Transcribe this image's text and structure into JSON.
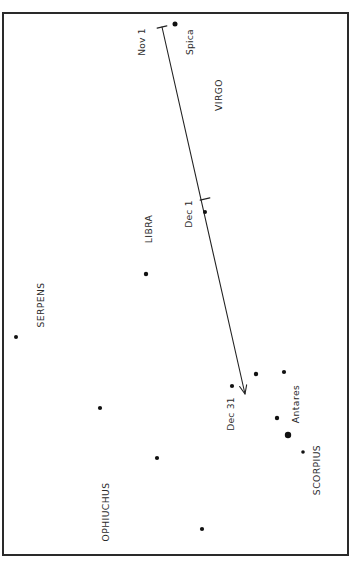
{
  "figure": {
    "kind": "star-chart",
    "background_color": "#ffffff",
    "frame_color": "#2a2a2a",
    "star_color": "#111111",
    "path_color": "#232323",
    "label_color": "#2b2b2b",
    "orientation_note": "all text rendered rotated 90 degrees (reading bottom-to-top)"
  },
  "chart_data": {
    "type": "scatter",
    "title": "",
    "subtitle": "",
    "xlabel": "",
    "ylabel": "",
    "grid": false,
    "legend": "none",
    "xlim": [
      3,
      348
    ],
    "ylim": [
      13,
      555
    ],
    "axis_units": "pixels",
    "frame": {
      "x": 3,
      "y": 13,
      "width": 345,
      "height": 542
    },
    "series": [
      {
        "name": "Stars",
        "type": "scatter",
        "points": [
          {
            "label": "Spica",
            "x": 175,
            "y": 24,
            "size": 5.0,
            "magnitude_rank": 2
          },
          {
            "label": "",
            "x": 205,
            "y": 212,
            "size": 4.0,
            "magnitude_rank": 3
          },
          {
            "label": "",
            "x": 146,
            "y": 274,
            "size": 4.4,
            "magnitude_rank": 3
          },
          {
            "label": "",
            "x": 16,
            "y": 337,
            "size": 4.0,
            "magnitude_rank": 3
          },
          {
            "label": "",
            "x": 284,
            "y": 372,
            "size": 4.2,
            "magnitude_rank": 3
          },
          {
            "label": "",
            "x": 256,
            "y": 374,
            "size": 4.4,
            "magnitude_rank": 3
          },
          {
            "label": "",
            "x": 232,
            "y": 386,
            "size": 4.2,
            "magnitude_rank": 3
          },
          {
            "label": "",
            "x": 100,
            "y": 408,
            "size": 4.2,
            "magnitude_rank": 3
          },
          {
            "label": "",
            "x": 277,
            "y": 418,
            "size": 4.4,
            "magnitude_rank": 3
          },
          {
            "label": "Antares",
            "x": 288,
            "y": 435,
            "size": 6.4,
            "magnitude_rank": 1
          },
          {
            "label": "",
            "x": 157,
            "y": 458,
            "size": 4.2,
            "magnitude_rank": 3
          },
          {
            "label": "",
            "x": 303,
            "y": 452,
            "size": 3.6,
            "magnitude_rank": 4
          },
          {
            "label": "",
            "x": 202,
            "y": 529,
            "size": 4.2,
            "magnitude_rank": 3
          }
        ]
      },
      {
        "name": "Planet path",
        "type": "line",
        "start": {
          "x": 162,
          "y": 27
        },
        "end": {
          "x": 245,
          "y": 394
        },
        "arrow_at": "end",
        "date_ticks": [
          {
            "date_label": "Nov 1",
            "x": 162,
            "y": 27
          },
          {
            "date_label": "Dec 1",
            "x": 205,
            "y": 199
          },
          {
            "date_label": "Dec 31",
            "x": 245,
            "y": 394
          }
        ]
      }
    ]
  },
  "labels": {
    "constellations": [
      {
        "name": "VIRGO",
        "x": 219,
        "y": 95
      },
      {
        "name": "LIBRA",
        "x": 149,
        "y": 229
      },
      {
        "name": "SERPENS",
        "x": 41,
        "y": 305
      },
      {
        "name": "Antares",
        "x": 296,
        "y": 404
      },
      {
        "name": "SCORPIUS",
        "x": 317,
        "y": 470
      },
      {
        "name": "OPHIUCHUS",
        "x": 106,
        "y": 512
      }
    ],
    "stars": [
      {
        "name": "Spica",
        "x": 190,
        "y": 42
      }
    ],
    "dates": [
      {
        "name": "Nov 1",
        "x": 142,
        "y": 42
      },
      {
        "name": "Dec 1",
        "x": 189,
        "y": 214
      },
      {
        "name": "Dec 31",
        "x": 231,
        "y": 414
      }
    ]
  }
}
